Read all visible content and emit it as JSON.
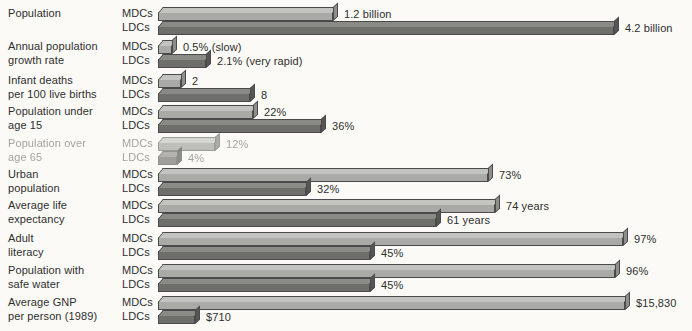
{
  "chart_data": {
    "type": "bar",
    "title": "",
    "subtitle": "",
    "xlabel": "",
    "ylabel": "",
    "orientation": "horizontal",
    "grid": false,
    "legend_position": "inline-row-labels",
    "series_labels": [
      "MDCs",
      "LDCs"
    ],
    "categories": [
      "Population",
      "Annual population growth rate",
      "Infant deaths per 100 live births",
      "Population under age 15",
      "Population over age 65",
      "Urban population",
      "Average life expectancy",
      "Adult literacy",
      "Population with safe water",
      "Average GNP per person (1989)"
    ],
    "series": [
      {
        "name": "MDCs",
        "values": [
          1.2,
          0.5,
          2,
          22,
          12,
          73,
          74,
          97,
          96,
          15830
        ],
        "value_labels": [
          "1.2 billion",
          "0.5% (slow)",
          "2",
          "22%",
          "12%",
          "73%",
          "74 years",
          "97%",
          "96%",
          "$15,830"
        ]
      },
      {
        "name": "LDCs",
        "values": [
          4.2,
          2.1,
          8,
          36,
          4,
          32,
          61,
          45,
          45,
          710
        ],
        "value_labels": [
          "4.2 billion",
          "2.1% (very rapid)",
          "8",
          "36%",
          "4%",
          "32%",
          "61 years",
          "45%",
          "45%",
          "$710"
        ]
      }
    ],
    "units_note": "Each category uses its own scale; bar lengths are relative within each row pair."
  },
  "rows": [
    {
      "id": "population",
      "label": "Population",
      "label_lines": "Population",
      "mdc": {
        "tier": "MDCs",
        "value_label": "1.2 billion",
        "bar_px": 175
      },
      "ldc": {
        "tier": "LDCs",
        "value_label": "4.2 billion",
        "bar_px": 456
      },
      "faded": false
    },
    {
      "id": "annual-population-growth-rate",
      "label": "Annual population growth rate",
      "label_lines": "Annual population\ngrowth rate",
      "mdc": {
        "tier": "MDCs",
        "value_label": "0.5% (slow)",
        "bar_px": 14
      },
      "ldc": {
        "tier": "LDCs",
        "value_label": "2.1% (very rapid)",
        "bar_px": 48
      },
      "faded": false
    },
    {
      "id": "infant-deaths-per-100-live-births",
      "label": "Infant deaths per 100 live births",
      "label_lines": "Infant deaths\nper 100 live births",
      "mdc": {
        "tier": "MDCs",
        "value_label": "2",
        "bar_px": 23
      },
      "ldc": {
        "tier": "LDCs",
        "value_label": "8",
        "bar_px": 92
      },
      "faded": false
    },
    {
      "id": "population-under-age-15",
      "label": "Population under age 15",
      "label_lines": "Population under\nage 15",
      "mdc": {
        "tier": "MDCs",
        "value_label": "22%",
        "bar_px": 95
      },
      "ldc": {
        "tier": "LDCs",
        "value_label": "36%",
        "bar_px": 163
      },
      "faded": false
    },
    {
      "id": "population-over-age-65",
      "label": "Population over age 65",
      "label_lines": "Population over\nage 65",
      "mdc": {
        "tier": "MDCs",
        "value_label": "12%",
        "bar_px": 57
      },
      "ldc": {
        "tier": "LDCs",
        "value_label": "4%",
        "bar_px": 19
      },
      "faded": true
    },
    {
      "id": "urban-population",
      "label": "Urban population",
      "label_lines": "Urban\npopulation",
      "mdc": {
        "tier": "MDCs",
        "value_label": "73%",
        "bar_px": 330
      },
      "ldc": {
        "tier": "LDCs",
        "value_label": "32%",
        "bar_px": 148
      },
      "faded": false
    },
    {
      "id": "average-life-expectancy",
      "label": "Average life expectancy",
      "label_lines": "Average life\nexpectancy",
      "mdc": {
        "tier": "MDCs",
        "value_label": "74 years",
        "bar_px": 337
      },
      "ldc": {
        "tier": "LDCs",
        "value_label": "61 years",
        "bar_px": 278
      },
      "faded": false
    },
    {
      "id": "adult-literacy",
      "label": "Adult literacy",
      "label_lines": "Adult\nliteracy",
      "mdc": {
        "tier": "MDCs",
        "value_label": "97%",
        "bar_px": 465
      },
      "ldc": {
        "tier": "LDCs",
        "value_label": "45%",
        "bar_px": 212
      },
      "faded": false
    },
    {
      "id": "population-with-safe-water",
      "label": "Population with safe water",
      "label_lines": "Population with\nsafe water",
      "mdc": {
        "tier": "MDCs",
        "value_label": "96%",
        "bar_px": 457
      },
      "ldc": {
        "tier": "LDCs",
        "value_label": "45%",
        "bar_px": 212
      },
      "faded": false
    },
    {
      "id": "average-gnp-per-person-1989",
      "label": "Average GNP per person (1989)",
      "label_lines": "Average GNP\nper person (1989)",
      "mdc": {
        "tier": "MDCs",
        "value_label": "$15,830",
        "bar_px": 467
      },
      "ldc": {
        "tier": "LDCs",
        "value_label": "$710",
        "bar_px": 37
      },
      "faded": false
    }
  ],
  "colors": {
    "background": "#fbfaf6",
    "mdc_front": "#a9a9a5",
    "mdc_top": "#c3c3bf",
    "ldc_front": "#6e6e6b",
    "ldc_top": "#8a8a87",
    "outline": "#4a4a4a",
    "text": "#2e2e2e"
  }
}
